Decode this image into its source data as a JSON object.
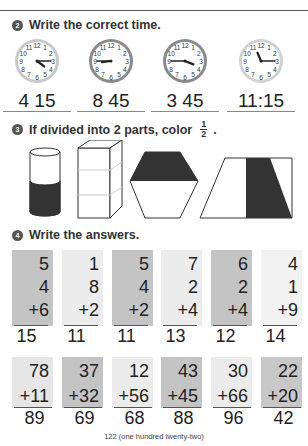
{
  "section2": {
    "number": "2",
    "title": "Write the correct time.",
    "clocks": [
      {
        "answer": "4:15",
        "display": "4 15",
        "ring": "#c8c8c8",
        "hour_deg": 127,
        "min_deg": 90
      },
      {
        "answer": "8:45",
        "display": "8 45",
        "ring": "#8a8a8a",
        "hour_deg": 262,
        "min_deg": 270
      },
      {
        "answer": "3:45",
        "display": "3 45",
        "ring": "#8a8a8a",
        "hour_deg": 112,
        "min_deg": 270
      },
      {
        "answer": "11:15",
        "display": "11:15",
        "ring": "#d2d2d2",
        "hour_deg": 337,
        "min_deg": 90
      }
    ]
  },
  "section3": {
    "number": "3",
    "title": "If divided into 2 parts, color",
    "fraction_num": "1",
    "fraction_den": "2",
    "period": ".",
    "shapes": [
      "cylinder",
      "rectangular-prism",
      "hexagon",
      "trapezoid"
    ]
  },
  "section4": {
    "number": "4",
    "title": "Write the answers.",
    "row1": [
      {
        "a": "5",
        "b": "4",
        "c": "+6",
        "answer": "15",
        "shade": "#c4c4c4"
      },
      {
        "a": "1",
        "b": "8",
        "c": "+2",
        "answer": "11",
        "shade": "#ececec"
      },
      {
        "a": "5",
        "b": "4",
        "c": "+2",
        "answer": "11",
        "shade": "#c4c4c4"
      },
      {
        "a": "7",
        "b": "2",
        "c": "+4",
        "answer": "13",
        "shade": "#ececec"
      },
      {
        "a": "6",
        "b": "2",
        "c": "+4",
        "answer": "12",
        "shade": "#c4c4c4"
      },
      {
        "a": "4",
        "b": "1",
        "c": "+9",
        "answer": "14",
        "shade": "#f2f2f2"
      }
    ],
    "row2": [
      {
        "a": "78",
        "b": "+11",
        "answer": "89",
        "shade": "#e6e6e6"
      },
      {
        "a": "37",
        "b": "+32",
        "answer": "69",
        "shade": "#c4c4c4"
      },
      {
        "a": "12",
        "b": "+56",
        "answer": "68",
        "shade": "#ececec"
      },
      {
        "a": "43",
        "b": "+45",
        "answer": "88",
        "shade": "#c4c4c4"
      },
      {
        "a": "30",
        "b": "+66",
        "answer": "96",
        "shade": "#ececec"
      },
      {
        "a": "22",
        "b": "+20",
        "answer": "42",
        "shade": "#c8c8c8"
      }
    ]
  },
  "footer": {
    "page": "122 (one hundred twenty-two)"
  }
}
